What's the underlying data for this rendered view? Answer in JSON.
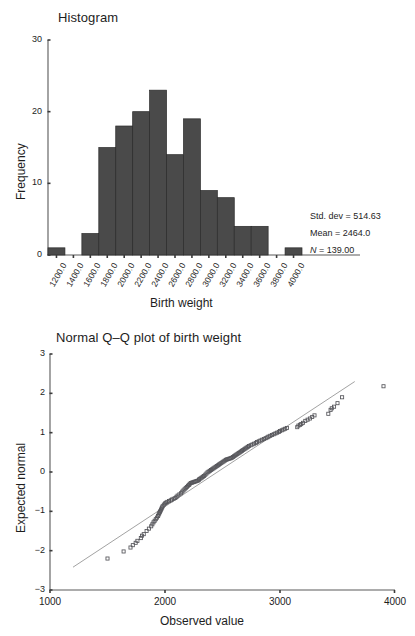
{
  "figure": {
    "panels": [
      {
        "id": "histogram",
        "title": "Histogram",
        "xlabel": "Birth weight",
        "ylabel": "Frequency"
      },
      {
        "id": "qq",
        "title": "Normal Q–Q plot of birth weight",
        "xlabel": "Observed value",
        "ylabel": "Expected normal"
      }
    ]
  },
  "stats": {
    "sd_label": "Std. dev = 514.63",
    "mean_label": "Mean = 2464.0",
    "n_symbol": "N",
    "n_value": " = 139.00"
  },
  "chart_data": [
    {
      "type": "bar",
      "title": "Histogram",
      "xlabel": "Birth weight",
      "ylabel": "Frequency",
      "xlim": [
        1100,
        4100
      ],
      "ylim": [
        0,
        30
      ],
      "yticks": [
        0,
        10,
        20,
        30
      ],
      "ytick_labels": [
        "0",
        "10",
        "20",
        "30"
      ],
      "xtick_labels": [
        "1200.0",
        "1400.0",
        "1600.0",
        "1800.0",
        "2000.0",
        "2200.0",
        "2400.0",
        "2600.0",
        "2800.0",
        "3000.0",
        "3200.0",
        "3400.0",
        "3600.0",
        "3800.0",
        "4000.0"
      ],
      "xticks": [
        1200,
        1400,
        1600,
        1800,
        2000,
        2200,
        2400,
        2600,
        2800,
        3000,
        3200,
        3400,
        3600,
        3800,
        4000
      ],
      "bin_width": 200,
      "bin_starts": [
        1100,
        1300,
        1500,
        1700,
        1900,
        2100,
        2300,
        2500,
        2700,
        2900,
        3100,
        3300,
        3500,
        3700,
        3900
      ],
      "bin_centers": [
        1200,
        1400,
        1600,
        1800,
        2000,
        2200,
        2400,
        2600,
        2800,
        3000,
        3200,
        3400,
        3600,
        3800,
        4000
      ],
      "values": [
        1,
        0,
        3,
        15,
        18,
        20,
        23,
        14,
        19,
        9,
        8,
        4,
        4,
        0,
        1
      ],
      "grid": false,
      "legend": "none",
      "annotations": [
        "Std. dev = 514.63",
        "Mean = 2464.0",
        "N = 139.00"
      ],
      "summary": {
        "std_dev": 514.63,
        "mean": 2464.0,
        "n": 139.0
      }
    },
    {
      "type": "scatter",
      "title": "Normal Q–Q plot of birth weight",
      "xlabel": "Observed value",
      "ylabel": "Expected normal",
      "xlim": [
        1000,
        4000
      ],
      "ylim": [
        -3,
        3
      ],
      "xticks": [
        1000,
        2000,
        3000,
        4000
      ],
      "xtick_labels": [
        "1000",
        "2000",
        "3000",
        "4000"
      ],
      "yticks": [
        -3,
        -2,
        -1,
        0,
        1,
        2,
        3
      ],
      "ytick_labels": [
        "−3",
        "−2",
        "−1",
        "0",
        "1",
        "2",
        "3"
      ],
      "grid": false,
      "legend": "none",
      "reference_line": {
        "x": [
          1200,
          3650
        ],
        "y": [
          -2.42,
          2.3
        ]
      },
      "marker": "open-square",
      "n_points": 139,
      "x": [
        1500,
        1640,
        1700,
        1720,
        1745,
        1760,
        1790,
        1800,
        1815,
        1840,
        1860,
        1880,
        1890,
        1900,
        1910,
        1920,
        1930,
        1940,
        1945,
        1950,
        1955,
        1960,
        1965,
        1970,
        1975,
        1980,
        1990,
        2000,
        2010,
        2020,
        2035,
        2050,
        2060,
        2075,
        2090,
        2100,
        2110,
        2125,
        2140,
        2150,
        2160,
        2170,
        2180,
        2190,
        2200,
        2210,
        2215,
        2225,
        2235,
        2245,
        2255,
        2265,
        2275,
        2285,
        2295,
        2300,
        2310,
        2320,
        2330,
        2340,
        2350,
        2360,
        2370,
        2380,
        2390,
        2400,
        2410,
        2420,
        2430,
        2440,
        2450,
        2460,
        2470,
        2480,
        2490,
        2500,
        2510,
        2520,
        2530,
        2540,
        2550,
        2560,
        2570,
        2580,
        2590,
        2600,
        2610,
        2620,
        2630,
        2640,
        2650,
        2660,
        2670,
        2680,
        2690,
        2700,
        2710,
        2720,
        2730,
        2745,
        2760,
        2775,
        2790,
        2800,
        2815,
        2830,
        2845,
        2860,
        2875,
        2890,
        2900,
        2915,
        2930,
        2945,
        2960,
        2975,
        2990,
        3000,
        3015,
        3030,
        3045,
        3060,
        3150,
        3160,
        3175,
        3185,
        3200,
        3220,
        3240,
        3260,
        3280,
        3300,
        3420,
        3440,
        3450,
        3470,
        3500,
        3540,
        3900
      ],
      "y": [
        -2.2,
        -2.02,
        -1.92,
        -1.86,
        -1.8,
        -1.75,
        -1.68,
        -1.62,
        -1.58,
        -1.5,
        -1.44,
        -1.38,
        -1.33,
        -1.28,
        -1.24,
        -1.2,
        -1.16,
        -1.12,
        -1.08,
        -1.05,
        -1.02,
        -0.99,
        -0.96,
        -0.93,
        -0.9,
        -0.87,
        -0.83,
        -0.8,
        -0.78,
        -0.76,
        -0.74,
        -0.72,
        -0.7,
        -0.68,
        -0.66,
        -0.63,
        -0.6,
        -0.57,
        -0.54,
        -0.5,
        -0.47,
        -0.44,
        -0.41,
        -0.38,
        -0.35,
        -0.33,
        -0.3,
        -0.28,
        -0.27,
        -0.26,
        -0.25,
        -0.24,
        -0.23,
        -0.22,
        -0.2,
        -0.18,
        -0.16,
        -0.14,
        -0.12,
        -0.1,
        -0.07,
        -0.04,
        -0.01,
        0.01,
        0.03,
        0.05,
        0.07,
        0.09,
        0.11,
        0.13,
        0.15,
        0.17,
        0.19,
        0.21,
        0.23,
        0.25,
        0.27,
        0.29,
        0.31,
        0.32,
        0.33,
        0.34,
        0.35,
        0.36,
        0.38,
        0.4,
        0.42,
        0.44,
        0.46,
        0.48,
        0.5,
        0.52,
        0.54,
        0.56,
        0.58,
        0.6,
        0.62,
        0.64,
        0.66,
        0.68,
        0.7,
        0.72,
        0.74,
        0.76,
        0.78,
        0.8,
        0.82,
        0.84,
        0.86,
        0.88,
        0.9,
        0.92,
        0.94,
        0.96,
        0.98,
        1.0,
        1.02,
        1.04,
        1.06,
        1.08,
        1.1,
        1.12,
        1.14,
        1.18,
        1.2,
        1.22,
        1.25,
        1.3,
        1.33,
        1.36,
        1.4,
        1.44,
        1.48,
        1.58,
        1.62,
        1.66,
        1.75,
        1.9,
        2.18,
        2.44
      ]
    }
  ]
}
